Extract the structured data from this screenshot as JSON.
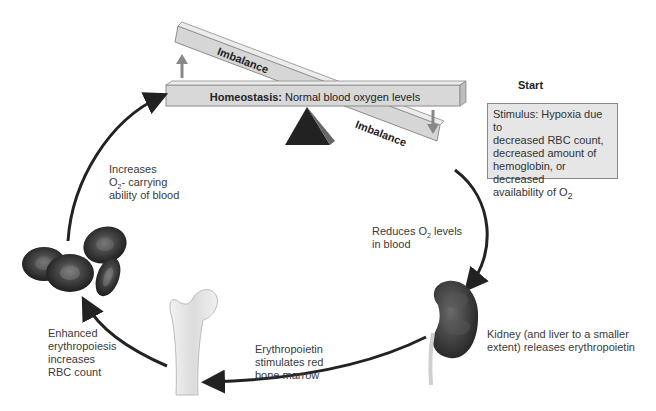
{
  "diagram": {
    "seesaw": {
      "homeostasis_bold": "Homeostasis:",
      "homeostasis_text": " Normal blood oxygen levels",
      "imbalance_top": "Imbalance",
      "imbalance_bottom": "Imbalance"
    },
    "start_label": "Start",
    "stimulus": {
      "line1": "Stimulus: Hypoxia due to",
      "line2": "decreased RBC count,",
      "line3": "decreased amount of",
      "line4": "hemoglobin, or decreased",
      "line5_prefix": "availability of O",
      "line5_sub": "2"
    },
    "steps": {
      "reduces": {
        "prefix": "Reduces O",
        "sub": "2",
        "suffix": " levels",
        "line2": "in blood"
      },
      "kidney": {
        "line1": "Kidney (and liver to a smaller",
        "line2": "extent) releases erythropoietin"
      },
      "epo": {
        "line1": "Erythropoietin",
        "line2": "stimulates red",
        "line3": "bone marrow"
      },
      "enhanced": {
        "line1": "Enhanced",
        "line2": "erythropoiesis",
        "line3": "increases",
        "line4": "RBC count"
      },
      "increases": {
        "line1": "Increases",
        "prefix": "O",
        "sub": "2",
        "suffix": "- carrying",
        "line3": "ability of blood"
      }
    },
    "colors": {
      "beam": "#d8d8d8",
      "beam_edge": "#999999",
      "fulcrum": "#222222",
      "arrow": "#222222",
      "rbc": "#3a3a3a",
      "stimulus_bg": "#e6e6e6"
    }
  }
}
